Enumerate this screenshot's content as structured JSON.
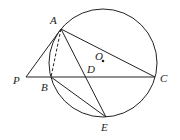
{
  "diagram": {
    "type": "geometry-circle-figure",
    "circle": {
      "center_label": "O",
      "cx": 103,
      "cy": 63,
      "r": 54
    },
    "points": {
      "A": {
        "label": "A",
        "x": 61,
        "y": 29
      },
      "B": {
        "label": "B",
        "x": 51,
        "y": 77
      },
      "C": {
        "label": "C",
        "x": 155,
        "y": 77
      },
      "D": {
        "label": "D",
        "x": 88,
        "y": 77
      },
      "E": {
        "label": "E",
        "x": 106,
        "y": 117
      },
      "P": {
        "label": "P",
        "x": 26,
        "y": 77
      },
      "O": {
        "label": "O",
        "x": 103,
        "y": 61
      }
    },
    "segments": [
      {
        "from": "P",
        "to": "A",
        "style": "solid"
      },
      {
        "from": "P",
        "to": "C",
        "style": "solid"
      },
      {
        "from": "A",
        "to": "C",
        "style": "solid"
      },
      {
        "from": "A",
        "to": "E",
        "style": "solid"
      },
      {
        "from": "B",
        "to": "E",
        "style": "solid"
      },
      {
        "from": "A",
        "to": "B",
        "style": "dashed"
      }
    ]
  }
}
